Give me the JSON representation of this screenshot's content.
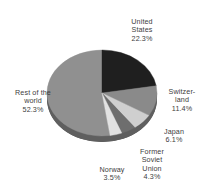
{
  "chart_data": {
    "type": "pie",
    "title": "",
    "subtitle": "",
    "xlabel": "",
    "ylabel": "",
    "legend_position": "none",
    "grid": false,
    "style": "3d-pie",
    "start_angle_deg": 0,
    "direction": "clockwise",
    "units": "percent",
    "total": 99.9,
    "categories": [
      "United States",
      "Switzerland",
      "Japan",
      "Former Soviet Union",
      "Norway",
      "Rest of the world"
    ],
    "values": [
      22.3,
      11.4,
      6.1,
      4.3,
      3.5,
      52.3
    ],
    "value_labels": [
      "22.3%",
      "11.4%",
      "6.1%",
      "4.3%",
      "3.5%",
      "52.3%"
    ],
    "slice_colors": [
      "#1f1f1f",
      "#8a8a8a",
      "#cfcfcf",
      "#6e6e6e",
      "#e2e2e2",
      "#909090"
    ],
    "slices": [
      {
        "name": "United States",
        "label_lines": "United\nStates",
        "value": 22.3,
        "value_label": "22.3%",
        "color": "#1f1f1f"
      },
      {
        "name": "Switzerland",
        "label_lines": "Switzer-\nland",
        "value": 11.4,
        "value_label": "11.4%",
        "color": "#8a8a8a"
      },
      {
        "name": "Japan",
        "label_lines": "Japan",
        "value": 6.1,
        "value_label": "6.1%",
        "color": "#cfcfcf"
      },
      {
        "name": "Former Soviet Union",
        "label_lines": "Former\nSoviet\nUnion",
        "value": 4.3,
        "value_label": "4.3%",
        "color": "#6e6e6e"
      },
      {
        "name": "Norway",
        "label_lines": "Norway",
        "value": 3.5,
        "value_label": "3.5%",
        "color": "#e2e2e2"
      },
      {
        "name": "Rest of the world",
        "label_lines": "Rest of the\nworld",
        "value": 52.3,
        "value_label": "52.3%",
        "color": "#909090"
      }
    ]
  },
  "colors": {
    "background": "#ffffff",
    "text": "#404040",
    "depth_shadow": "#5c5c5c"
  }
}
